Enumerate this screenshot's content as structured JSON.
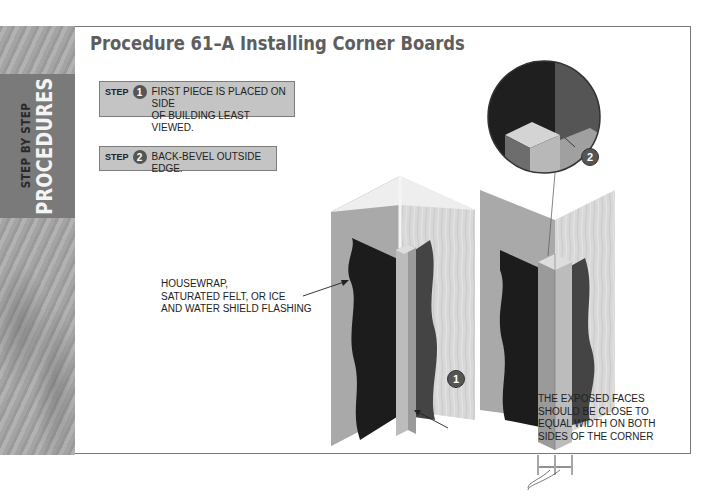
{
  "sidebar": {
    "line1": "STEP BY STEP",
    "line2": "PROCEDURES"
  },
  "header": {
    "title": "Procedure 61–A Installing Corner Boards"
  },
  "steps": [
    {
      "label": "STEP",
      "number": "1",
      "text_line1": "FIRST PIECE IS PLACED ON SIDE",
      "text_line2": "OF BUILDING LEAST VIEWED."
    },
    {
      "label": "STEP",
      "number": "2",
      "text_line1": "BACK-BEVEL OUTSIDE EDGE.",
      "text_line2": ""
    }
  ],
  "illustration": {
    "left_label": [
      "HOUSEWRAP,",
      "SATURATED FELT, OR ICE",
      "AND WATER SHIELD FLASHING"
    ],
    "right_label": [
      "THE EXPOSED FACES",
      "SHOULD BE CLOSE TO",
      "EQUAL WIDTH ON BOTH",
      "SIDES OF THE CORNER"
    ],
    "callout_1": "1",
    "callout_2": "2"
  },
  "colors": {
    "badge": "#555555",
    "step_box": "#c4c4c4",
    "title": "#5e5e5e",
    "sidebar_band": "#7a7a7a"
  }
}
